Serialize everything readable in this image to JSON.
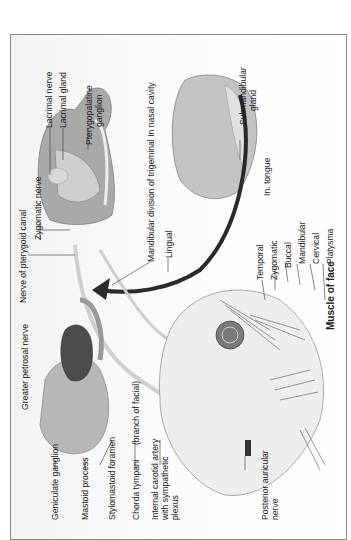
{
  "figure": {
    "title": "Muscle of face",
    "labels": {
      "lacrimal_nerve": "Lacrimal nerve",
      "lacrimal_gland": "Lacrimal gland",
      "pterygopalatine_ganglion_1": "Pterygopalatine",
      "pterygopalatine_ganglion_2": "ganglion",
      "nerve_pterygoid_canal": "Nerve of pterygoid canal",
      "zygomatic_nerve": "Zygomatic nerve",
      "mandibular_division": "Mandibular division of trigeminal  In nasal cavity",
      "lingual": "Lingual",
      "submandibular_gland_1": "Submandibular",
      "submandibular_gland_2": "gland",
      "in_tongue": "In. tongue",
      "temporal": "Temporal",
      "zygomatic": "Zygomatic",
      "buccal": "Buccal",
      "mandibular": "Mandibular",
      "cervical": "Cervical",
      "platysma": "Platysma",
      "greater_petrosal_nerve": "Greater petrosal nerve",
      "geniculate_ganglion": "Geniculate ganglion",
      "mastoid_process": "Mastoid process",
      "stylomastoid_foramen": "Stylomastoid foramen",
      "chorda_tympani": "Chorda tympani",
      "branch_of_facial": "(branch of facial)",
      "internal_carotid_1": "Internal carotid artery",
      "internal_carotid_2": "with sympathetic",
      "internal_carotid_3": "plexus",
      "posterior_auricular_1": "Posterior auricular",
      "posterior_auricular_2": "nerve"
    }
  }
}
